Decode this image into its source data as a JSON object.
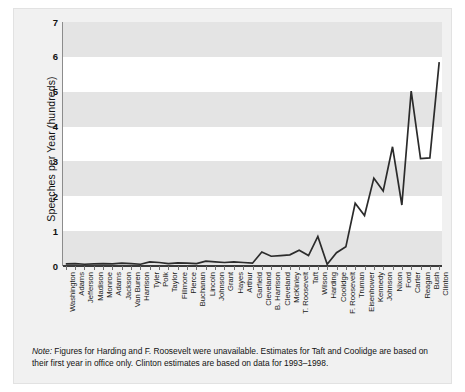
{
  "chart_data": {
    "type": "line",
    "title": "",
    "xlabel": "",
    "ylabel": "Speeches per Year (hundreds)",
    "ylim": [
      0,
      7
    ],
    "yticks": [
      0,
      1,
      2,
      3,
      4,
      5,
      6,
      7
    ],
    "grid": "horizontal-alternating-bands",
    "legend": "none",
    "categories": [
      "Washington",
      "Adams",
      "Jefferson",
      "Madison",
      "Monroe",
      "Adams",
      "Jackson",
      "Van Buren",
      "Harrison",
      "Tyler",
      "Polk",
      "Taylor",
      "Fillmore",
      "Pierce",
      "Buchanan",
      "Lincoln",
      "Johnson",
      "Grant",
      "Hayes",
      "Arthur",
      "Garfield",
      "Cleveland",
      "B. Harrison",
      "Cleveland",
      "McKinley",
      "T. Roosevelt",
      "Taft",
      "Wilson",
      "Harding",
      "Coolidge",
      "F. Roosevelt",
      "Truman",
      "Eisenhower",
      "Kennedy",
      "Johnson",
      "Nixon",
      "Ford",
      "Carter",
      "Reagan",
      "Bush",
      "Clinton"
    ],
    "values": [
      0.06,
      0.07,
      0.05,
      0.06,
      0.07,
      0.06,
      0.08,
      0.07,
      0.05,
      0.12,
      0.1,
      0.07,
      0.09,
      0.08,
      0.07,
      0.14,
      0.12,
      0.1,
      0.12,
      0.1,
      0.08,
      0.4,
      0.28,
      0.3,
      0.32,
      0.45,
      0.3,
      0.85,
      0.05,
      0.38,
      0.55,
      1.8,
      1.45,
      2.52,
      2.15,
      3.42,
      1.75,
      5.02,
      3.08,
      3.1,
      5.85
    ],
    "annotations": []
  },
  "axis": {
    "y_label": "Speeches per Year (hundreds)",
    "y_ticks": [
      "7",
      "6",
      "5",
      "4",
      "3",
      "2",
      "1",
      "0"
    ]
  },
  "note": {
    "label": "Note:",
    "text": " Figures for Harding and F. Roosevelt were unavailable. Estimates for Taft and Coolidge are based on their first year in office only. Clinton estimates are based on data for 1993–1998."
  },
  "colors": {
    "line": "#2b2b2b",
    "band": "#e4e4e4",
    "panel": "#f1f1f1",
    "plot_background": "#ffffff",
    "text": "#111111"
  }
}
